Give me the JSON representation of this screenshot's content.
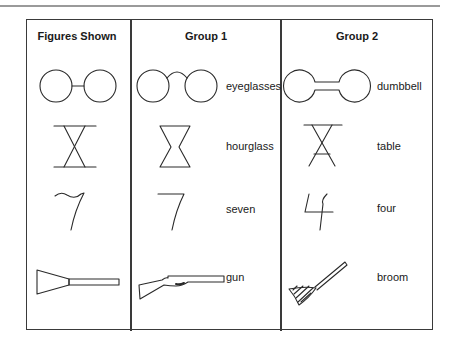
{
  "headers": {
    "figures": "Figures Shown",
    "group1": "Group 1",
    "group2": "Group 2"
  },
  "rows": [
    {
      "figure_icon": "circles-joined-by-line-icon",
      "group1": {
        "icon": "eyeglasses-icon",
        "label": "eyeglasses"
      },
      "group2": {
        "icon": "dumbbell-icon",
        "label": "dumbbell"
      }
    },
    {
      "figure_icon": "crossed-lines-between-bars-icon",
      "group1": {
        "icon": "hourglass-icon",
        "label": "hourglass"
      },
      "group2": {
        "icon": "table-icon",
        "label": "table"
      }
    },
    {
      "figure_icon": "wavy-seven-icon",
      "group1": {
        "icon": "seven-icon",
        "label": "seven"
      },
      "group2": {
        "icon": "four-icon",
        "label": "four"
      }
    },
    {
      "figure_icon": "trapezoid-with-handle-icon",
      "group1": {
        "icon": "gun-icon",
        "label": "gun"
      },
      "group2": {
        "icon": "broom-icon",
        "label": "broom"
      }
    }
  ],
  "colors": {
    "line": "#2a2a2a",
    "frame": "#3a3a3a",
    "top_rule": "#9a9a9a"
  }
}
